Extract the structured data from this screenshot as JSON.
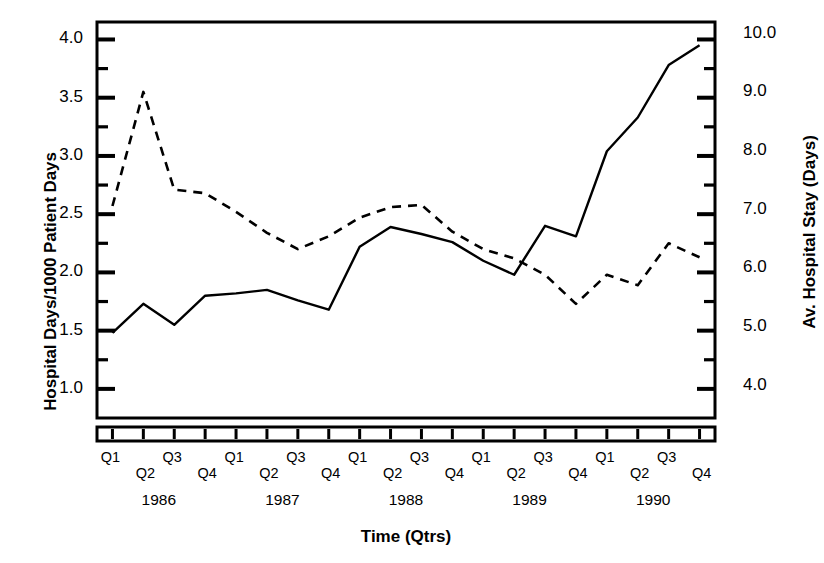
{
  "chart_data": {
    "type": "line",
    "title": "",
    "xlabel": "Time (Qtrs)",
    "ylabel": "Hospital Days/1000 Patient Days",
    "ylabel_right": "Av. Hospital Stay (Days)",
    "ylim": [
      0.75,
      4.15
    ],
    "ylim_right": [
      3.45,
      10.2
    ],
    "yticks": [
      "1.0",
      "1.5",
      "2.0",
      "2.5",
      "3.0",
      "3.5",
      "4.0"
    ],
    "ytick_values": [
      1.0,
      1.5,
      2.0,
      2.5,
      3.0,
      3.5,
      4.0
    ],
    "yticks_right": [
      "4.0",
      "5.0",
      "6.0",
      "7.0",
      "8.0",
      "9.0",
      "10.0"
    ],
    "ytick_right_values": [
      4.0,
      5.0,
      6.0,
      7.0,
      8.0,
      9.0,
      10.0
    ],
    "minor_tick_step": 0.25,
    "grid": false,
    "legend": "none",
    "categories": [
      "Q1",
      "Q2",
      "Q3",
      "Q4",
      "Q1",
      "Q2",
      "Q3",
      "Q4",
      "Q1",
      "Q2",
      "Q3",
      "Q4",
      "Q1",
      "Q2",
      "Q3",
      "Q4",
      "Q1",
      "Q2",
      "Q3",
      "Q4"
    ],
    "years": [
      "1986",
      "1987",
      "1988",
      "1989",
      "1990"
    ],
    "x": [
      "1986 Q1",
      "1986 Q2",
      "1986 Q3",
      "1986 Q4",
      "1987 Q1",
      "1987 Q2",
      "1987 Q3",
      "1987 Q4",
      "1988 Q1",
      "1988 Q2",
      "1988 Q3",
      "1988 Q4",
      "1989 Q1",
      "1989 Q2",
      "1989 Q3",
      "1989 Q4",
      "1990 Q1",
      "1990 Q2",
      "1990 Q3",
      "1990 Q4"
    ],
    "series": [
      {
        "name": "Hospital Days/1000 Patient Days",
        "axis": "left",
        "style": "solid",
        "color": "#000000",
        "values": [
          1.48,
          1.73,
          1.55,
          1.8,
          1.82,
          1.85,
          1.76,
          1.68,
          2.22,
          2.39,
          2.33,
          2.26,
          2.1,
          1.98,
          2.4,
          2.31,
          3.04,
          3.33,
          3.78,
          3.95
        ]
      },
      {
        "name": "Av. Hospital Stay (Days)",
        "axis": "right",
        "style": "dashed",
        "color": "#000000",
        "values_left_scale": [
          2.57,
          3.55,
          2.71,
          2.68,
          2.52,
          2.34,
          2.2,
          2.31,
          2.47,
          2.56,
          2.58,
          2.35,
          2.2,
          2.12,
          1.98,
          1.73,
          1.98,
          1.89,
          2.25,
          2.13,
          1.9
        ],
        "values": [
          7.24,
          9.19,
          7.52,
          7.46,
          7.14,
          6.78,
          6.46,
          6.68,
          6.99,
          7.17,
          7.21,
          6.75,
          6.46,
          6.3,
          6.0,
          5.47,
          6.0,
          5.82,
          6.54,
          6.3
        ]
      }
    ]
  },
  "axes": {
    "left_label": "Hospital Days/1000 Patient Days",
    "right_label": "Av. Hospital Stay (Days)",
    "bottom_label": "Time (Qtrs)"
  }
}
